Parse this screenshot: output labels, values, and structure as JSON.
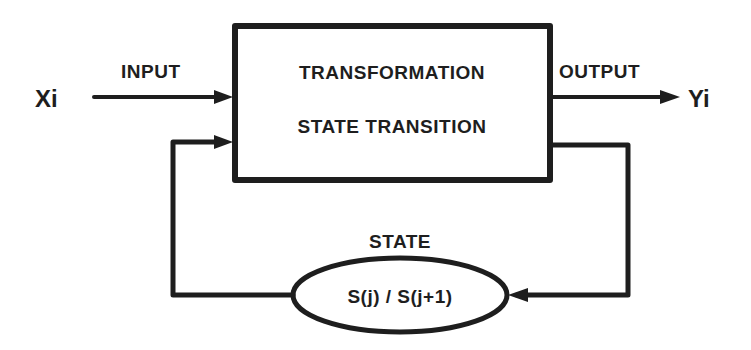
{
  "diagram": {
    "type": "block-diagram",
    "colors": {
      "stroke": "#1e1e1e",
      "background": "#ffffff"
    },
    "input": {
      "variable": "Xi",
      "label": "INPUT"
    },
    "output": {
      "variable": "Yi",
      "label": "OUTPUT"
    },
    "process_box": {
      "line1": "TRANSFORMATION",
      "line2": "STATE TRANSITION"
    },
    "state": {
      "label": "STATE",
      "value": "S(j) / S(j+1)"
    },
    "edges": [
      {
        "from": "Xi",
        "to": "process_box",
        "label": "INPUT"
      },
      {
        "from": "process_box",
        "to": "Yi",
        "label": "OUTPUT"
      },
      {
        "from": "process_box",
        "to": "state"
      },
      {
        "from": "state",
        "to": "process_box"
      }
    ]
  }
}
